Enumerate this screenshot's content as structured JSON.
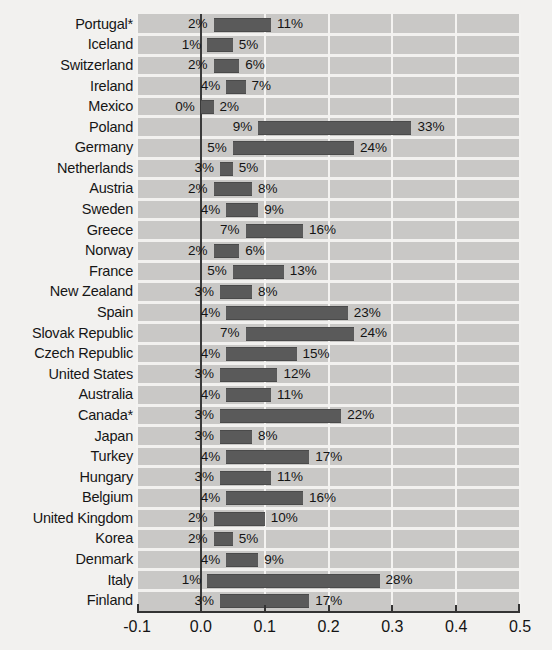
{
  "chart_data": {
    "type": "bar",
    "subtype": "floating-range-bar",
    "title": "",
    "xlabel": "",
    "ylabel": "",
    "xlim": [
      -0.1,
      0.5
    ],
    "xticks": [
      "-0.1",
      "0.0",
      "0.1",
      "0.2",
      "0.3",
      "0.4",
      "0.5"
    ],
    "xtick_values": [
      -0.1,
      0.0,
      0.1,
      0.2,
      0.3,
      0.4,
      0.5
    ],
    "grid": true,
    "legend": "none",
    "categories": [
      "Portugal*",
      "Iceland",
      "Switzerland",
      "Ireland",
      "Mexico",
      "Poland",
      "Germany",
      "Netherlands",
      "Austria",
      "Sweden",
      "Greece",
      "Norway",
      "France",
      "New Zealand",
      "Spain",
      "Slovak Republic",
      "Czech Republic",
      "United States",
      "Australia",
      "Canada*",
      "Japan",
      "Turkey",
      "Hungary",
      "Belgium",
      "United Kingdom",
      "Korea",
      "Denmark",
      "Italy",
      "Finland"
    ],
    "series": [
      {
        "name": "low",
        "values": [
          0.02,
          0.01,
          0.02,
          0.04,
          0.0,
          0.09,
          0.05,
          0.03,
          0.02,
          0.04,
          0.07,
          0.02,
          0.05,
          0.03,
          0.04,
          0.07,
          0.04,
          0.03,
          0.04,
          0.03,
          0.03,
          0.04,
          0.03,
          0.04,
          0.02,
          0.02,
          0.04,
          0.01,
          0.03
        ]
      },
      {
        "name": "high",
        "values": [
          0.11,
          0.05,
          0.06,
          0.07,
          0.02,
          0.33,
          0.24,
          0.05,
          0.08,
          0.09,
          0.16,
          0.06,
          0.13,
          0.08,
          0.23,
          0.24,
          0.15,
          0.12,
          0.11,
          0.22,
          0.08,
          0.17,
          0.11,
          0.16,
          0.1,
          0.05,
          0.09,
          0.28,
          0.17
        ]
      }
    ],
    "rows": [
      {
        "country": "Portugal*",
        "low_label": "2%",
        "high_label": "11%",
        "low": 0.02,
        "high": 0.11
      },
      {
        "country": "Iceland",
        "low_label": "1%",
        "high_label": "5%",
        "low": 0.01,
        "high": 0.05
      },
      {
        "country": "Switzerland",
        "low_label": "2%",
        "high_label": "6%",
        "low": 0.02,
        "high": 0.06
      },
      {
        "country": "Ireland",
        "low_label": "4%",
        "high_label": "7%",
        "low": 0.04,
        "high": 0.07
      },
      {
        "country": "Mexico",
        "low_label": "0%",
        "high_label": "2%",
        "low": 0.0,
        "high": 0.02
      },
      {
        "country": "Poland",
        "low_label": "9%",
        "high_label": "33%",
        "low": 0.09,
        "high": 0.33
      },
      {
        "country": "Germany",
        "low_label": "5%",
        "high_label": "24%",
        "low": 0.05,
        "high": 0.24
      },
      {
        "country": "Netherlands",
        "low_label": "3%",
        "high_label": "5%",
        "low": 0.03,
        "high": 0.05
      },
      {
        "country": "Austria",
        "low_label": "2%",
        "high_label": "8%",
        "low": 0.02,
        "high": 0.08
      },
      {
        "country": "Sweden",
        "low_label": "4%",
        "high_label": "9%",
        "low": 0.04,
        "high": 0.09
      },
      {
        "country": "Greece",
        "low_label": "7%",
        "high_label": "16%",
        "low": 0.07,
        "high": 0.16
      },
      {
        "country": "Norway",
        "low_label": "2%",
        "high_label": "6%",
        "low": 0.02,
        "high": 0.06
      },
      {
        "country": "France",
        "low_label": "5%",
        "high_label": "13%",
        "low": 0.05,
        "high": 0.13
      },
      {
        "country": "New Zealand",
        "low_label": "3%",
        "high_label": "8%",
        "low": 0.03,
        "high": 0.08
      },
      {
        "country": "Spain",
        "low_label": "4%",
        "high_label": "23%",
        "low": 0.04,
        "high": 0.23
      },
      {
        "country": "Slovak Republic",
        "low_label": "7%",
        "high_label": "24%",
        "low": 0.07,
        "high": 0.24
      },
      {
        "country": "Czech Republic",
        "low_label": "4%",
        "high_label": "15%",
        "low": 0.04,
        "high": 0.15
      },
      {
        "country": "United States",
        "low_label": "3%",
        "high_label": "12%",
        "low": 0.03,
        "high": 0.12
      },
      {
        "country": "Australia",
        "low_label": "4%",
        "high_label": "11%",
        "low": 0.04,
        "high": 0.11
      },
      {
        "country": "Canada*",
        "low_label": "3%",
        "high_label": "22%",
        "low": 0.03,
        "high": 0.22
      },
      {
        "country": "Japan",
        "low_label": "3%",
        "high_label": "8%",
        "low": 0.03,
        "high": 0.08
      },
      {
        "country": "Turkey",
        "low_label": "4%",
        "high_label": "17%",
        "low": 0.04,
        "high": 0.17
      },
      {
        "country": "Hungary",
        "low_label": "3%",
        "high_label": "11%",
        "low": 0.03,
        "high": 0.11
      },
      {
        "country": "Belgium",
        "low_label": "4%",
        "high_label": "16%",
        "low": 0.04,
        "high": 0.16
      },
      {
        "country": "United Kingdom",
        "low_label": "2%",
        "high_label": "10%",
        "low": 0.02,
        "high": 0.1
      },
      {
        "country": "Korea",
        "low_label": "2%",
        "high_label": "5%",
        "low": 0.02,
        "high": 0.05
      },
      {
        "country": "Denmark",
        "low_label": "4%",
        "high_label": "9%",
        "low": 0.04,
        "high": 0.09
      },
      {
        "country": "Italy",
        "low_label": "1%",
        "high_label": "28%",
        "low": 0.01,
        "high": 0.28
      },
      {
        "country": "Finland",
        "low_label": "3%",
        "high_label": "17%",
        "low": 0.03,
        "high": 0.17
      }
    ]
  },
  "colors": {
    "bar": "#5a5a5a",
    "plot_background": "#c9c8c6",
    "page_background": "#f2f1ef",
    "gridline": "#f4f3f1",
    "axis": "#333333",
    "text": "#141414"
  }
}
